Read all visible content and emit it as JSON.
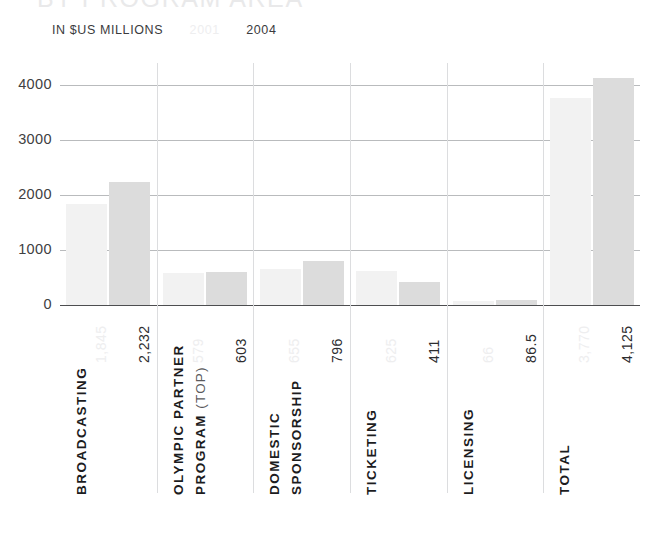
{
  "header": {
    "title": "BY PROGRAM AREA",
    "units_label": "IN $US MILLIONS"
  },
  "legend": {
    "year_2001": "2001",
    "year_2004": "2004"
  },
  "chart_data": {
    "type": "bar",
    "title": "BY PROGRAM AREA",
    "subtitle": "IN $US MILLIONS",
    "xlabel": "",
    "ylabel": "",
    "ylim": [
      0,
      4400
    ],
    "grid": true,
    "legend_position": "top-left",
    "yticks": [
      "0",
      "1000",
      "2000",
      "3000",
      "4000"
    ],
    "ytick_values": [
      0,
      1000,
      2000,
      3000,
      4000
    ],
    "categories": [
      "BROADCASTING",
      "OLYMPIC PARTNER PROGRAM (TOP)",
      "DOMESTIC SPONSORSHIP",
      "TICKETING",
      "LICENSING",
      "TOTAL"
    ],
    "category_lines": [
      [
        "BROADCASTING"
      ],
      [
        "OLYMPIC PARTNER",
        "PROGRAM (TOP)"
      ],
      [
        "DOMESTIC",
        "SPONSORSHIP"
      ],
      [
        "TICKETING"
      ],
      [
        "LICENSING"
      ],
      [
        "TOTAL"
      ]
    ],
    "series": [
      {
        "name": "2001",
        "color": "#f2f2f2",
        "values": [
          1845,
          579,
          655,
          625,
          66,
          3770
        ],
        "labels": [
          "1,845",
          "579",
          "655",
          "625",
          "66",
          "3,770"
        ]
      },
      {
        "name": "2004",
        "color": "#dcdcdc",
        "values": [
          2232,
          603,
          796,
          411,
          86.5,
          4125
        ],
        "labels": [
          "2,232",
          "603",
          "796",
          "411",
          "86.5",
          "4,125"
        ]
      }
    ]
  }
}
